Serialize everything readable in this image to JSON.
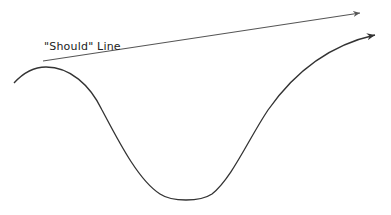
{
  "diagram": {
    "type": "sketch",
    "labels": {
      "should_line": "\"Should\" Line"
    },
    "lines": [
      {
        "name": "should-line",
        "kind": "straight-arrow",
        "from": [
          43,
          61
        ],
        "to": [
          360,
          13
        ],
        "color": "#555555"
      },
      {
        "name": "actual-curve",
        "kind": "curved-arrow",
        "from": [
          14,
          83
        ],
        "to": [
          375,
          35
        ],
        "color": "#333333",
        "shape": "peak then deep trough then rising"
      }
    ]
  }
}
